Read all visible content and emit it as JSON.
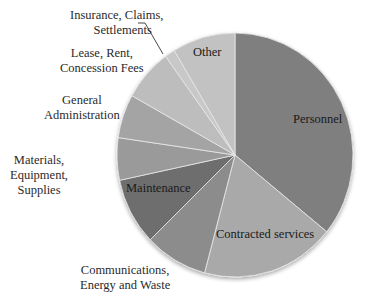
{
  "chart_data": {
    "type": "pie",
    "title": "",
    "start": "top",
    "direction": "clockwise",
    "slices": [
      {
        "name": "Personnel",
        "value": 35.8,
        "color": "#7f7f7f"
      },
      {
        "name": "Contracted services",
        "value": 18.3,
        "color": "#a9a9a9"
      },
      {
        "name": "Communications, Energy and Waste",
        "value": 8.6,
        "color": "#8c8c8c"
      },
      {
        "name": "Maintenance",
        "value": 8.9,
        "color": "#6e6e6e"
      },
      {
        "name": "Materials, Equipment, Supplies",
        "value": 5.6,
        "color": "#9a9a9a"
      },
      {
        "name": "General Administration",
        "value": 5.8,
        "color": "#a4a4a4"
      },
      {
        "name": "Lease, Rent, Concession Fees",
        "value": 6.9,
        "color": "#bdbdbd"
      },
      {
        "name": "Insurance, Claims, Settlements",
        "value": 1.4,
        "color": "#c8c8c8"
      },
      {
        "name": "Other",
        "value": 8.6,
        "color": "#c2c2c2"
      }
    ],
    "labels": {
      "personnel": "Personnel",
      "contracted": "Contracted services",
      "communications": [
        "Communications,",
        "Energy and Waste"
      ],
      "maintenance": "Maintenance",
      "materials": [
        "Materials,",
        "Equipment,",
        "Supplies"
      ],
      "general": [
        "General",
        "Administration"
      ],
      "lease": [
        "Lease, Rent,",
        "Concession Fees"
      ],
      "insurance": [
        "Insurance, Claims,",
        "Settlements"
      ],
      "other": "Other"
    }
  }
}
